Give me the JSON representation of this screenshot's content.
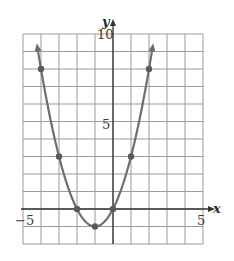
{
  "chart_data": {
    "type": "line",
    "title": "",
    "xlabel": "x",
    "ylabel": "y",
    "xlim": [
      -5,
      5
    ],
    "ylim": [
      -2,
      10
    ],
    "grid": true,
    "x_tick_labels": [
      "-5",
      "5"
    ],
    "y_tick_labels": [
      "5",
      "10"
    ],
    "function": "y = x^2 + 2x",
    "curve_domain": [
      -4.2,
      2.2
    ],
    "series": [
      {
        "name": "parabola",
        "points": [
          {
            "x": -4,
            "y": 8
          },
          {
            "x": -3,
            "y": 3
          },
          {
            "x": -2,
            "y": 0
          },
          {
            "x": -1,
            "y": -1
          },
          {
            "x": 0,
            "y": 0
          },
          {
            "x": 1,
            "y": 3
          },
          {
            "x": 2,
            "y": 8
          }
        ],
        "color": "#6e6e6e"
      }
    ]
  },
  "labels": {
    "x_axis": "x",
    "y_axis": "y",
    "x_min": "−5",
    "x_max": "5",
    "y_mid": "5",
    "y_max": "10"
  },
  "colors": {
    "grid": "#9a9a9a",
    "axis": "#333333",
    "curve": "#6e6e6e",
    "point": "#5a5a5a"
  }
}
